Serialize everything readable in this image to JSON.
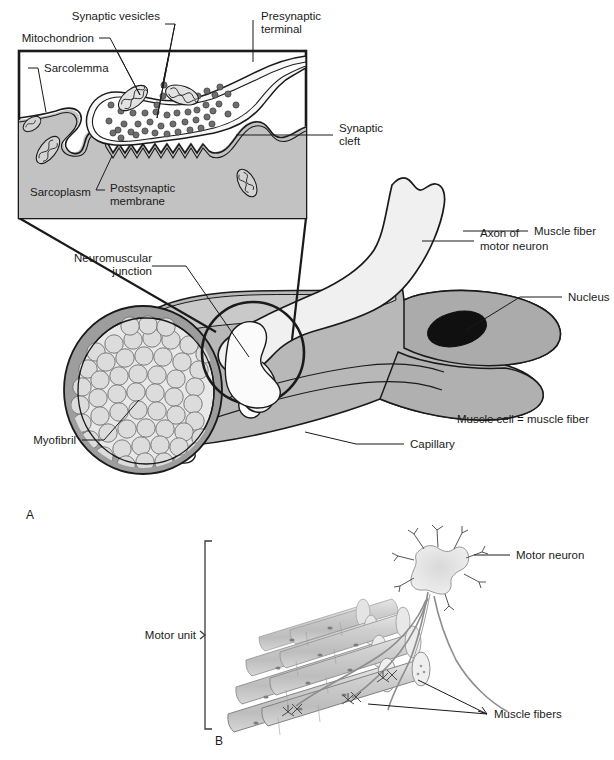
{
  "figure": {
    "panels": [
      {
        "id": "A",
        "label": "A"
      },
      {
        "id": "B",
        "label": "B"
      }
    ]
  },
  "inset": {
    "name": "neuromuscular-junction-detail",
    "labels": {
      "synaptic_vesicles": "Synaptic vesicles",
      "mitochondrion": "Mitochondrion",
      "presynaptic_terminal_line1": "Presynaptic",
      "presynaptic_terminal_line2": "terminal",
      "sarcolemma": "Sarcolemma",
      "synaptic_cleft_line1": "Synaptic",
      "synaptic_cleft_line2": "cleft",
      "sarcoplasm": "Sarcoplasm",
      "postsynaptic_membrane_line1": "Postsynaptic",
      "postsynaptic_membrane_line2": "membrane"
    }
  },
  "panel_a": {
    "labels": {
      "neuromuscular_junction_line1": "Neuromuscular",
      "neuromuscular_junction_line2": "junction",
      "axon_line1": "Axon of",
      "axon_line2": "motor neuron",
      "muscle_fiber": "Muscle fiber",
      "nucleus": "Nucleus",
      "muscle_cell_equals": "Muscle cell = muscle fiber",
      "capillary": "Capillary",
      "myofibril": "Myofibril"
    }
  },
  "panel_b": {
    "labels": {
      "motor_neuron": "Motor neuron",
      "motor_unit": "Motor unit",
      "muscle_fibers": "Muscle fibers"
    }
  },
  "colors": {
    "background": "#ffffff",
    "ink": "#1a1a1a",
    "sarcoplasm_gray": "#c2c2c2",
    "terminal_fill": "#f4f4f4",
    "axon_fill": "#f0f0f0",
    "muscle_gray": "#b8b8b8",
    "muscle_gray_dark": "#a8a8a8",
    "myofibril_fill": "#dcdcdc",
    "myofibril_ring": "#9a9a9a",
    "nucleus_fill": "#101010",
    "vesicle_fill": "#6e6e6e",
    "mito_fill": "#e2e2e2",
    "panelb_fiber": "#c8c8c8",
    "panelb_neuron": "#cfcfcf"
  }
}
